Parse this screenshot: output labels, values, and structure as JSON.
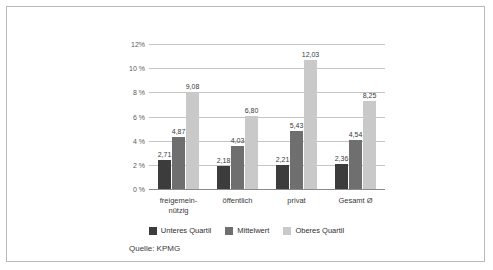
{
  "chart_data": {
    "type": "bar",
    "title": "",
    "subtitle": "",
    "xlabel": "",
    "ylabel": "",
    "categories": [
      "freigemein-\nnützig",
      "öffentlich",
      "privat",
      "Gesamt Ø"
    ],
    "category_lines": [
      [
        "freigemein-",
        "nützig"
      ],
      [
        "öffentlich",
        ""
      ],
      [
        "privat",
        ""
      ],
      [
        "Gesamt Ø",
        ""
      ]
    ],
    "series": [
      {
        "name": "Unteres Quartil",
        "color": "#3c3c3c",
        "values": [
          2.71,
          2.18,
          2.21,
          2.36
        ],
        "labels": [
          "2,71",
          "2,18",
          "2,21",
          "2,36"
        ]
      },
      {
        "name": "Mittelwert",
        "color": "#6f6f6f",
        "values": [
          4.87,
          4.03,
          5.43,
          4.54
        ],
        "labels": [
          "4,87",
          "4,03",
          "5,43",
          "4,54"
        ]
      },
      {
        "name": "Oberes Quartil",
        "color": "#c9c9c9",
        "values": [
          9.08,
          6.8,
          12.03,
          8.25
        ],
        "labels": [
          "9,08",
          "6,80",
          "12,03",
          "8,25"
        ]
      }
    ],
    "ylim": [
      0,
      13
    ],
    "yticks": [
      0,
      2,
      4,
      6,
      8,
      10,
      12
    ],
    "ytick_labels": [
      "0 %",
      "2 %",
      "4 %",
      "6 %",
      "8 %",
      "10 %",
      "12%"
    ],
    "grid": true,
    "legend_position": "bottom"
  },
  "legend": {
    "items": [
      {
        "label": "Unteres Quartil",
        "color": "#3c3c3c"
      },
      {
        "label": "Mittelwert",
        "color": "#6f6f6f"
      },
      {
        "label": "Oberes Quartil",
        "color": "#c9c9c9"
      }
    ]
  },
  "source": {
    "text": "Quelle: KPMG"
  }
}
